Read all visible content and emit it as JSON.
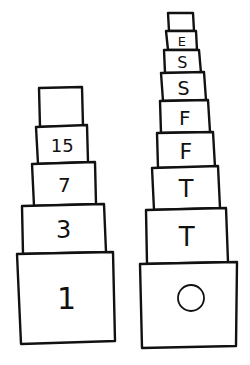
{
  "colors": {
    "background": "#ffffff",
    "stroke": "#111111"
  },
  "stacks": [
    {
      "name": "left-stack",
      "boxes": [
        {
          "label": "",
          "pts": [
            [
              39,
              88
            ],
            [
              82,
              87
            ],
            [
              83,
              126
            ],
            [
              40,
              127
            ]
          ],
          "fs": 0
        },
        {
          "label": "15",
          "pts": [
            [
              36,
              127
            ],
            [
              87,
              125
            ],
            [
              88,
              162
            ],
            [
              38,
              164
            ]
          ],
          "fs": 18
        },
        {
          "label": "7",
          "pts": [
            [
              32,
              164
            ],
            [
              95,
              162
            ],
            [
              96,
              204
            ],
            [
              34,
              206
            ]
          ],
          "fs": 20
        },
        {
          "label": "3",
          "pts": [
            [
              22,
              206
            ],
            [
              104,
              204
            ],
            [
              106,
              252
            ],
            [
              23,
              254
            ]
          ],
          "fs": 24
        },
        {
          "label": "1",
          "pts": [
            [
              17,
              254
            ],
            [
              113,
              252
            ],
            [
              115,
              341
            ],
            [
              21,
              344
            ]
          ],
          "fs": 30
        }
      ]
    },
    {
      "name": "right-stack",
      "boxes": [
        {
          "label": "",
          "pts": [
            [
              168,
              13
            ],
            [
              193,
              13
            ],
            [
              194,
              31
            ],
            [
              169,
              31
            ]
          ],
          "fs": 0
        },
        {
          "label": "E",
          "pts": [
            [
              166,
              31
            ],
            [
              196,
              31
            ],
            [
              197,
              50
            ],
            [
              168,
              50
            ]
          ],
          "fs": 13
        },
        {
          "label": "S",
          "pts": [
            [
              164,
              50
            ],
            [
              199,
              50
            ],
            [
              201,
              73
            ],
            [
              165,
              73
            ]
          ],
          "fs": 16
        },
        {
          "label": "S",
          "pts": [
            [
              161,
              73
            ],
            [
              204,
              72
            ],
            [
              206,
              100
            ],
            [
              163,
              101
            ]
          ],
          "fs": 19
        },
        {
          "label": "F",
          "pts": [
            [
              160,
              101
            ],
            [
              208,
              100
            ],
            [
              210,
              132
            ],
            [
              161,
              133
            ]
          ],
          "fs": 20
        },
        {
          "label": "F",
          "pts": [
            [
              157,
              133
            ],
            [
              213,
              132
            ],
            [
              215,
              167
            ],
            [
              158,
              168
            ]
          ],
          "fs": 22
        },
        {
          "label": "T",
          "pts": [
            [
              152,
              168
            ],
            [
              218,
              166
            ],
            [
              220,
              208
            ],
            [
              154,
              210
            ]
          ],
          "fs": 24
        },
        {
          "label": "T",
          "pts": [
            [
              146,
              210
            ],
            [
              226,
              208
            ],
            [
              228,
              262
            ],
            [
              147,
              264
            ]
          ],
          "fs": 26
        },
        {
          "label": "O",
          "pts": [
            [
              140,
              264
            ],
            [
              237,
              262
            ],
            [
              236,
              346
            ],
            [
              142,
              348
            ]
          ],
          "fs": 0,
          "circle": {
            "cx": 191,
            "cy": 298,
            "r": 13
          }
        }
      ]
    }
  ]
}
